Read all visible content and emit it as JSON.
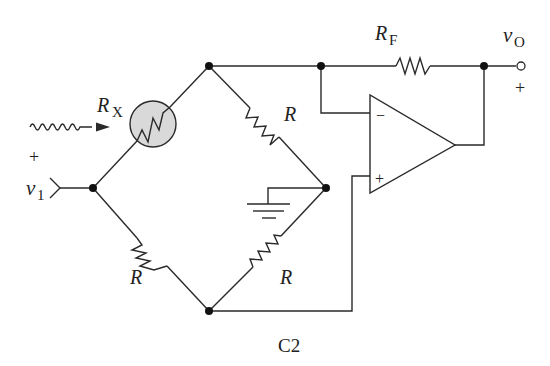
{
  "diagram": {
    "caption": "C2",
    "labels": {
      "rx_main": "R",
      "rx_sub": "X",
      "rf_main": "R",
      "rf_sub": "F",
      "r_top_right": "R",
      "r_bottom_left": "R",
      "r_bottom_right": "R",
      "vo_main": "v",
      "vo_sub": "O",
      "vo_plus": "+",
      "v1_main": "v",
      "v1_sub": "1",
      "v1_plus": "+",
      "opamp_minus": "−",
      "opamp_plus": "+"
    },
    "components": [
      {
        "id": "RX",
        "type": "thermistor/light-sensitive resistor",
        "fill": "#d9d9d9"
      },
      {
        "id": "R1",
        "type": "resistor",
        "position": "bridge top-right"
      },
      {
        "id": "R2",
        "type": "resistor",
        "position": "bridge bottom-left"
      },
      {
        "id": "R3",
        "type": "resistor",
        "position": "bridge bottom-right"
      },
      {
        "id": "RF",
        "type": "resistor",
        "position": "feedback"
      },
      {
        "id": "U1",
        "type": "op-amp"
      },
      {
        "id": "GND",
        "type": "ground"
      }
    ],
    "colors": {
      "line": "#2a2a2a",
      "rx_fill": "#d9d9d9"
    }
  }
}
